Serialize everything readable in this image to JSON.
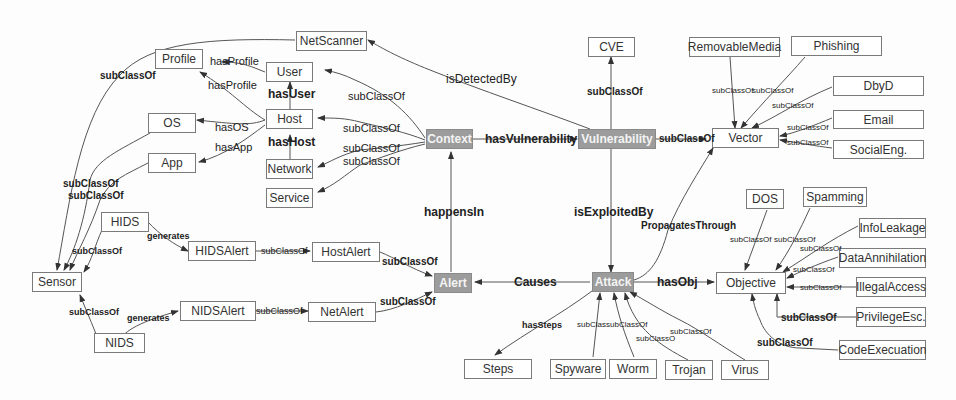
{
  "diagram": {
    "type": "ontology",
    "core_nodes": {
      "context": "Context",
      "vulnerability": "Vulnerability",
      "alert": "Alert",
      "attack": "Attack"
    },
    "nodes": {
      "netscanner": "NetScanner",
      "profile": "Profile",
      "user": "User",
      "host": "Host",
      "os": "OS",
      "app": "App",
      "network": "Network",
      "service": "Service",
      "sensor": "Sensor",
      "hids": "HIDS",
      "nids": "NIDS",
      "hidsalert": "HIDSAlert",
      "nidsalert": "NIDSAlert",
      "hostalert": "HostAlert",
      "netalert": "NetAlert",
      "cve": "CVE",
      "vector": "Vector",
      "removablemedia": "RemovableMedia",
      "phishing": "Phishing",
      "dbyd": "DbyD",
      "email": "Email",
      "socialeng": "SocialEng.",
      "objective": "Objective",
      "dos": "DOS",
      "spamming": "Spamming",
      "infoleakage": "InfoLeakage",
      "dataannihilation": "DataAnnihilation",
      "illegalaccess": "IllegalAccess",
      "privilegeesc": "PrivilegeEsc.",
      "codeexecuation": "CodeExecuation",
      "steps": "Steps",
      "spyware": "Spyware",
      "worm": "Worm",
      "trojan": "Trojan",
      "virus": "Virus"
    },
    "edge_labels": {
      "subclassof": "subClassOf",
      "hasprofile": "hasProfile",
      "hasuser": "hasUser",
      "hashost": "hasHost",
      "hasos": "hasOS",
      "hasapp": "hasApp",
      "generates": "generates",
      "isdetectedby": "isDetectedBy",
      "hasvulnerability": "hasVulnerability",
      "happensin": "happensIn",
      "isexploitedby": "isExploitedBy",
      "causes": "Causes",
      "propagatesthrough": "PropagatesThrough",
      "hasobj": "hasObj",
      "hassteps": "hasSteps",
      "subclas_trunc": "subClas",
      "subclassc_trunc": "subClassO"
    },
    "colors": {
      "core_fill": "#9c9c9c",
      "core_text": "#f4f4f4",
      "node_border": "#7a7a7a",
      "edge": "#555555"
    }
  }
}
